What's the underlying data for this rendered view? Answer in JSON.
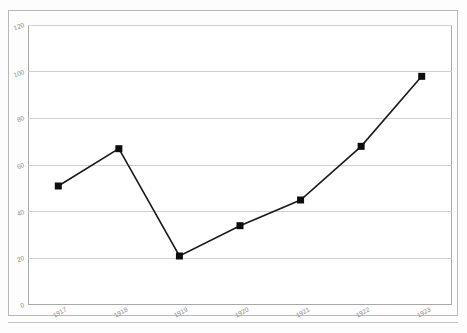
{
  "chart_data": {
    "type": "line",
    "title": "",
    "subtitle": "",
    "xlabel": "",
    "ylabel": "",
    "categories": [
      "1917",
      "1918",
      "1919",
      "1920",
      "1921",
      "1922",
      "1923"
    ],
    "values": [
      51,
      67,
      21,
      34,
      45,
      68,
      98
    ],
    "series": [
      {
        "name": "",
        "values": [
          51,
          67,
          21,
          34,
          45,
          68,
          98
        ]
      }
    ],
    "ylim": [
      0,
      120
    ],
    "yticks": [
      "0",
      "20",
      "40",
      "60",
      "80",
      "100",
      "120"
    ],
    "ytick_values": [
      0,
      20,
      40,
      60,
      80,
      100,
      120
    ],
    "xticks": [
      "1917",
      "1918",
      "1919",
      "1920",
      "1921",
      "1922",
      "1923"
    ],
    "grid": "horizontal",
    "legend": "none",
    "marker": "square",
    "line_color": "#1a1a1a",
    "marker_color": "#0d0d0d",
    "grid_color": "#cfcfcf",
    "axis_color": "#a8a8a8",
    "tick_label_color": "#8d8d8d",
    "background_color": "#ffffff",
    "annotations": []
  }
}
